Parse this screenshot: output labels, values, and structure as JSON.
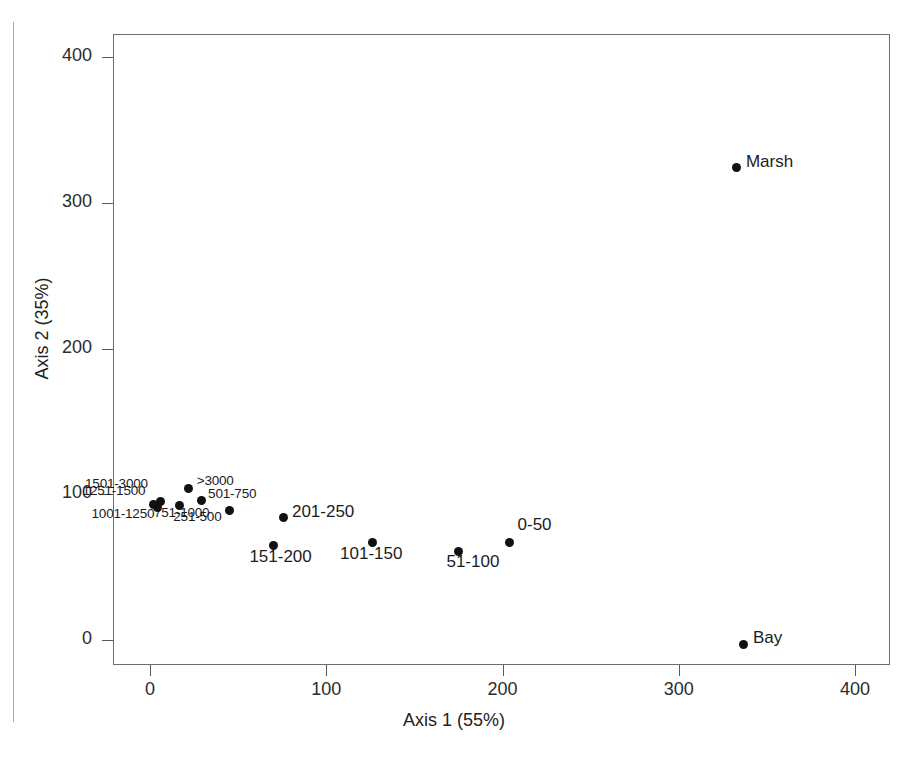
{
  "chart_data": {
    "type": "scatter",
    "title": "",
    "subtitle": "",
    "xlabel": "Axis 1 (55%)",
    "ylabel": "Axis 2 (35%)",
    "xlim": [
      -22,
      420
    ],
    "ylim": [
      -22,
      433
    ],
    "xticks": [
      0,
      100,
      200,
      300,
      400
    ],
    "xticklabels": [
      "0",
      "100",
      "200",
      "300",
      "400"
    ],
    "yticks": [
      0,
      100,
      200,
      300,
      400
    ],
    "yticklabels": [
      "0",
      "100",
      "200",
      "300",
      "400"
    ],
    "grid": false,
    "legend": false,
    "marker_color": "#111111",
    "frame_color": "#6e6e6e",
    "points": [
      {
        "label": "Marsh",
        "x": 333,
        "y": 324,
        "label_dx": 9,
        "label_dy": -9,
        "size": "big"
      },
      {
        "label": "Bay",
        "x": 337,
        "y": -3,
        "label_dx": 9,
        "label_dy": -9,
        "size": "big"
      },
      {
        "label": "0-50",
        "x": 204,
        "y": 67,
        "label_dx": 8,
        "label_dy": -20,
        "size": "big"
      },
      {
        "label": "51-100",
        "x": 175,
        "y": 61,
        "label_dx": -12,
        "label_dy": 8,
        "size": "big"
      },
      {
        "label": "101-150",
        "x": 126,
        "y": 67,
        "label_dx": -32,
        "label_dy": 9,
        "size": "big"
      },
      {
        "label": "151-200",
        "x": 70,
        "y": 65,
        "label_dx": -24,
        "label_dy": 9,
        "size": "big"
      },
      {
        "label": "201-250",
        "x": 76,
        "y": 84,
        "label_dx": 8,
        "label_dy": -9,
        "size": "big"
      },
      {
        "label": "251-500",
        "x": 45,
        "y": 89,
        "label_dx": -56,
        "label_dy": 6,
        "size": "small"
      },
      {
        "label": "501-750",
        "x": 29,
        "y": 96,
        "label_dx": 7,
        "label_dy": -7,
        "size": "small"
      },
      {
        "label": ">3000",
        "x": 22,
        "y": 104,
        "label_dx": 8,
        "label_dy": -8,
        "size": "small"
      },
      {
        "label": "751-1000",
        "x": 17,
        "y": 92,
        "label_dx": -26,
        "label_dy": 6,
        "size": "small"
      },
      {
        "label": "1251-1500",
        "x": 6,
        "y": 95,
        "label_dx": -78,
        "label_dy": -12,
        "size": "small"
      },
      {
        "label": "1501-3000",
        "x": 4,
        "y": 91,
        "label_dx": -72,
        "label_dy": -24,
        "size": "small"
      },
      {
        "label": "1001-1250",
        "x": 2,
        "y": 93,
        "label_dx": -62,
        "label_dy": 9,
        "size": "small"
      }
    ]
  },
  "axes": {
    "x_title": "Axis 1 (55%)",
    "y_title": "Axis 2 (35%)"
  }
}
